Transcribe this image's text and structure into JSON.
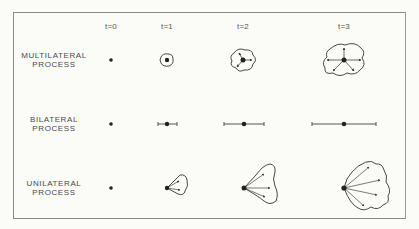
{
  "figure": {
    "columns": [
      {
        "label": "t=0",
        "x": 111
      },
      {
        "label": "t=1",
        "x": 167
      },
      {
        "label": "t=2",
        "x": 243
      },
      {
        "label": "t=3",
        "x": 344
      }
    ],
    "rows": [
      {
        "line1": "MULTILATERAL",
        "line2": "PROCESS",
        "y": 60
      },
      {
        "line1": "BILATERAL",
        "line2": "PROCESS",
        "y": 124
      },
      {
        "line1": "UNILATERAL",
        "line2": "PROCESS",
        "y": 188
      }
    ],
    "colors": {
      "ink": "#2a2a2a",
      "line": "#555555",
      "background": "#fbfbf7",
      "frame": "#8a8a8a"
    }
  }
}
